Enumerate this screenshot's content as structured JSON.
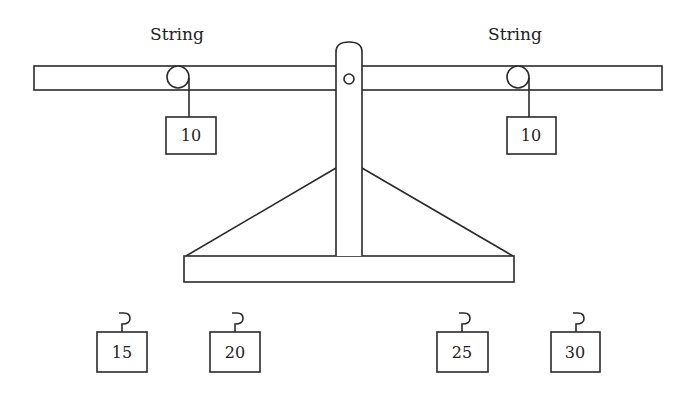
{
  "diagram": {
    "labels": {
      "left_string": "String",
      "right_string": "String"
    },
    "hanging_weights": [
      {
        "side": "left",
        "value": "10"
      },
      {
        "side": "right",
        "value": "10"
      }
    ],
    "loose_weights": [
      {
        "value": "15"
      },
      {
        "value": "20"
      },
      {
        "value": "25"
      },
      {
        "value": "30"
      }
    ],
    "colors": {
      "stroke": "#2a2a2a",
      "background": "#ffffff"
    }
  }
}
